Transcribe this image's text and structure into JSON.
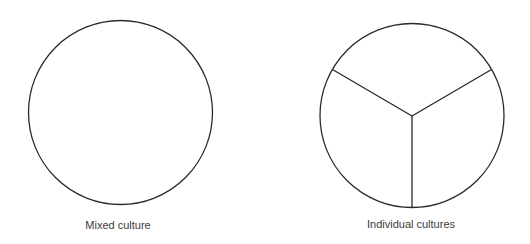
{
  "diagram": {
    "panels": [
      {
        "id": "mixed",
        "label": "Mixed culture",
        "circle": {
          "cx": 120.5,
          "cy": 112.5,
          "r": 92
        },
        "divisions": 0
      },
      {
        "id": "individual",
        "label": "Individual cultures",
        "circle": {
          "cx": 412,
          "cy": 115.5,
          "r": 92
        },
        "divisions": 3
      }
    ],
    "stroke_color": "#2a2a2a",
    "label_color": "#3a3a3a"
  }
}
